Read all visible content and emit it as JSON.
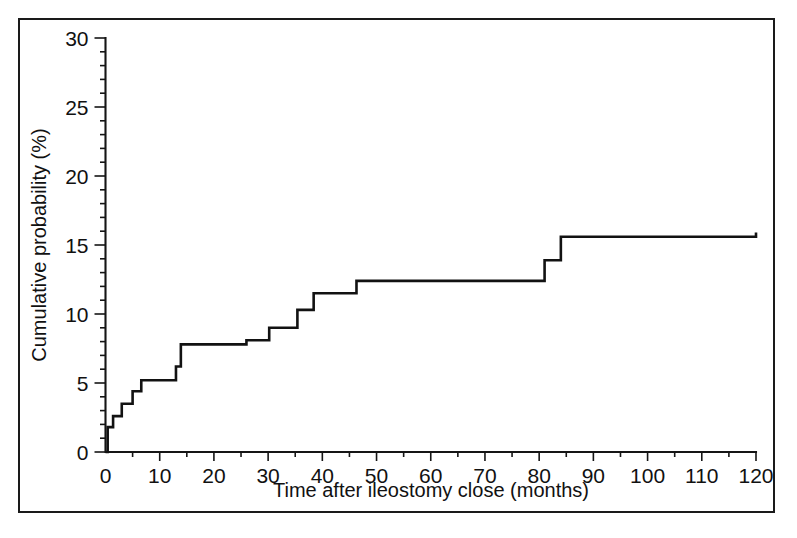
{
  "figure": {
    "background_color": "#ffffff",
    "border_color": "#1a1a1a",
    "line_color": "#121212"
  },
  "chart_data": {
    "type": "line",
    "subtype": "step",
    "title": "",
    "xlabel": "Time after ileostomy close (months)",
    "ylabel": "Cumulative probability (%)",
    "xlim": [
      0,
      120
    ],
    "ylim": [
      0,
      30
    ],
    "xticks": [
      0,
      10,
      20,
      30,
      40,
      50,
      60,
      70,
      80,
      90,
      100,
      110,
      120
    ],
    "xtick_labels": [
      "0",
      "10",
      "20",
      "30",
      "40",
      "50",
      "60",
      "70",
      "80",
      "90",
      "100",
      "110",
      "120"
    ],
    "yticks": [
      0,
      5,
      10,
      15,
      20,
      25,
      30
    ],
    "ytick_labels": [
      "0",
      "5",
      "10",
      "15",
      "20",
      "25",
      "30"
    ],
    "x_minor_tick_step": 5,
    "y_minor_tick_step": 1,
    "grid": false,
    "legend": false,
    "legend_position": "none",
    "series": [
      {
        "name": "Cumulative probability of recurrence",
        "step_type": "post",
        "x": [
          0,
          0.4,
          1.4,
          3.0,
          5.0,
          6.6,
          13.0,
          13.9,
          26.0,
          30.2,
          35.4,
          38.4,
          46.3,
          81.0,
          84.0,
          120
        ],
        "y": [
          0.0,
          1.8,
          2.6,
          3.5,
          4.4,
          5.2,
          6.2,
          7.8,
          8.1,
          9.0,
          10.3,
          11.5,
          12.4,
          13.9,
          15.6,
          15.9
        ]
      }
    ],
    "annotations": []
  }
}
